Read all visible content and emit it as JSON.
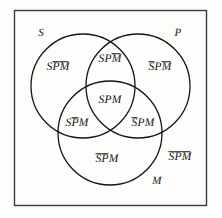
{
  "figure": {
    "name": "three-term-syllogism-venn-diagram",
    "universe_border_color": "#3b3a38",
    "circle_stroke_color": "#171513",
    "background_color": "#fdfdfc",
    "text_color": "#161412"
  },
  "circles": [
    {
      "id": "S",
      "label": "S",
      "cx": 83,
      "cy": 86,
      "r": 52
    },
    {
      "id": "P",
      "label": "P",
      "cx": 138,
      "cy": 86,
      "r": 52
    },
    {
      "id": "M",
      "label": "M",
      "cx": 110,
      "cy": 133,
      "r": 52
    }
  ],
  "circle_labels": [
    {
      "name": "circle-label-s",
      "text": "S",
      "x": 41,
      "y": 33
    },
    {
      "name": "circle-label-p",
      "text": "P",
      "x": 178,
      "y": 33
    },
    {
      "name": "circle-label-m",
      "text": "M",
      "x": 157,
      "y": 181
    }
  ],
  "regions": [
    {
      "name": "region-s-only",
      "id": "S-not-P-not-M",
      "x": 58,
      "y": 68,
      "parts": [
        {
          "text": "S",
          "bar": false
        },
        {
          "text": "P",
          "bar": true
        },
        {
          "text": "M",
          "bar": true
        }
      ],
      "plain": "SP̄M̄"
    },
    {
      "name": "region-sp-not-m",
      "id": "S-P-not-M",
      "x": 110,
      "y": 60,
      "parts": [
        {
          "text": "S",
          "bar": false
        },
        {
          "text": "P",
          "bar": false
        },
        {
          "text": "M",
          "bar": true
        }
      ],
      "plain": "SPM̄"
    },
    {
      "name": "region-p-only",
      "id": "not-S-P-not-M",
      "x": 160,
      "y": 68,
      "parts": [
        {
          "text": "S",
          "bar": true
        },
        {
          "text": "P",
          "bar": false
        },
        {
          "text": "M",
          "bar": true
        }
      ],
      "plain": "S̄PM̄"
    },
    {
      "name": "region-spm-center",
      "id": "S-P-M",
      "x": 110,
      "y": 101,
      "parts": [
        {
          "text": "S",
          "bar": false
        },
        {
          "text": "P",
          "bar": false
        },
        {
          "text": "M",
          "bar": false
        }
      ],
      "plain": "SPM"
    },
    {
      "name": "region-sm-not-p",
      "id": "S-not-P-M",
      "x": 77,
      "y": 124,
      "parts": [
        {
          "text": "S",
          "bar": false
        },
        {
          "text": "P",
          "bar": true
        },
        {
          "text": "M",
          "bar": false
        }
      ],
      "plain": "SP̄M"
    },
    {
      "name": "region-pm-not-s",
      "id": "not-S-P-M",
      "x": 143,
      "y": 124,
      "parts": [
        {
          "text": "S",
          "bar": true
        },
        {
          "text": "P",
          "bar": false
        },
        {
          "text": "M",
          "bar": false
        }
      ],
      "plain": "S̄PM"
    },
    {
      "name": "region-m-only",
      "id": "not-S-not-P-M",
      "x": 107,
      "y": 160,
      "parts": [
        {
          "text": "S",
          "bar": true
        },
        {
          "text": "P",
          "bar": true
        },
        {
          "text": "M",
          "bar": false
        }
      ],
      "plain": "S̄P̄M"
    },
    {
      "name": "region-outside-all",
      "id": "not-S-not-P-not-M",
      "x": 180,
      "y": 158,
      "parts": [
        {
          "text": "S",
          "bar": true
        },
        {
          "text": "P",
          "bar": true
        },
        {
          "text": "M",
          "bar": true
        }
      ],
      "plain": "S̄P̄M̄"
    }
  ],
  "universe_box": {
    "x": 14,
    "y": 10,
    "width": 193,
    "height": 196
  }
}
